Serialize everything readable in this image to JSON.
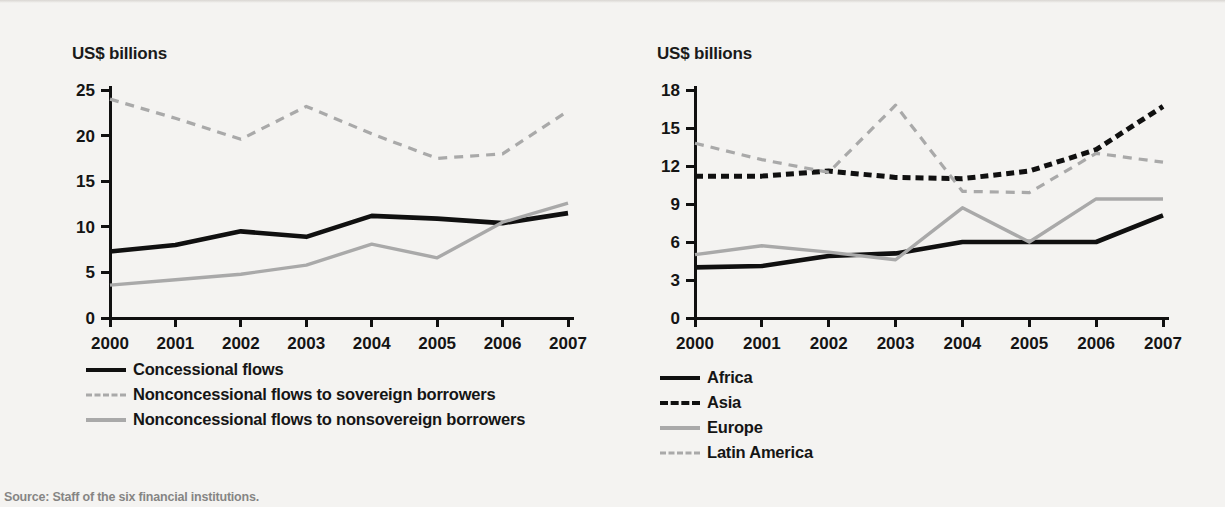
{
  "source_note": "Source: Staff of the six financial institutions.",
  "colors": {
    "black": "#101010",
    "gray": "#a9a9a9",
    "background": "#f4f3f1",
    "text": "#141414"
  },
  "chart_data": [
    {
      "type": "line",
      "panel": "left",
      "title": "US$ billions",
      "xlabel": "",
      "ylabel": "US$ billions",
      "x": [
        "2000",
        "2001",
        "2002",
        "2003",
        "2004",
        "2005",
        "2006",
        "2007"
      ],
      "categories": [
        "2000",
        "2001",
        "2002",
        "2003",
        "2004",
        "2005",
        "2006",
        "2007"
      ],
      "ylim": [
        0,
        25
      ],
      "yticks": [
        0,
        5,
        10,
        15,
        20,
        25
      ],
      "grid": false,
      "legend_position": "below-left",
      "series": [
        {
          "name": "Concessional flows",
          "style": "solid",
          "color": "#101010",
          "values": [
            7.3,
            8.0,
            9.5,
            8.9,
            11.2,
            10.9,
            10.4,
            11.5
          ]
        },
        {
          "name": "Nonconcessional flows to sovereign borrowers",
          "style": "dashed",
          "color": "#a9a9a9",
          "values": [
            24.0,
            21.9,
            19.6,
            23.2,
            20.2,
            17.5,
            18.0,
            22.7
          ]
        },
        {
          "name": "Nonconcessional flows to nonsovereign borrowers",
          "style": "solid",
          "color": "#a9a9a9",
          "values": [
            3.6,
            4.2,
            4.8,
            5.8,
            8.1,
            6.6,
            10.5,
            12.6
          ]
        }
      ],
      "last_point_note": "series 2 ends at 22.7 in 2007"
    },
    {
      "type": "line",
      "panel": "right",
      "title": "US$ billions",
      "xlabel": "",
      "ylabel": "US$ billions",
      "x": [
        "2000",
        "2001",
        "2002",
        "2003",
        "2004",
        "2005",
        "2006",
        "2007"
      ],
      "categories": [
        "2000",
        "2001",
        "2002",
        "2003",
        "2004",
        "2005",
        "2006",
        "2007"
      ],
      "ylim": [
        0,
        18
      ],
      "yticks": [
        0,
        3,
        6,
        9,
        12,
        15,
        18
      ],
      "grid": false,
      "legend_position": "below-center",
      "series": [
        {
          "name": "Africa",
          "style": "solid",
          "color": "#101010",
          "values": [
            4.0,
            4.1,
            4.9,
            5.1,
            6.0,
            6.0,
            6.0,
            8.1
          ]
        },
        {
          "name": "Asia",
          "style": "dashed",
          "color": "#101010",
          "values": [
            11.2,
            11.2,
            11.6,
            11.1,
            11.0,
            11.6,
            13.3,
            16.7
          ]
        },
        {
          "name": "Europe",
          "style": "solid",
          "color": "#a9a9a9",
          "values": [
            5.0,
            5.7,
            5.2,
            4.6,
            8.7,
            6.0,
            9.4,
            9.4
          ]
        },
        {
          "name": "Latin America",
          "style": "dashed",
          "color": "#a9a9a9",
          "values": [
            13.8,
            12.5,
            11.5,
            16.8,
            10.0,
            9.9,
            13.0,
            12.3
          ]
        }
      ]
    }
  ],
  "panels": {
    "left": {
      "axis_title": "US$ billions",
      "yticks": [
        "0",
        "5",
        "10",
        "15",
        "20",
        "25"
      ],
      "xticks": [
        "2000",
        "2001",
        "2002",
        "2003",
        "2004",
        "2005",
        "2006",
        "2007"
      ],
      "legend": [
        {
          "label": "Concessional flows",
          "swatch": "sw-solid-black"
        },
        {
          "label": "Nonconcessional flows to sovereign borrowers",
          "swatch": "sw-dash-gray"
        },
        {
          "label": "Nonconcessional flows to nonsovereign borrowers",
          "swatch": "sw-solid-gray"
        }
      ]
    },
    "right": {
      "axis_title": "US$ billions",
      "yticks": [
        "0",
        "3",
        "6",
        "9",
        "12",
        "15",
        "18"
      ],
      "xticks": [
        "2000",
        "2001",
        "2002",
        "2003",
        "2004",
        "2005",
        "2006",
        "2007"
      ],
      "legend": [
        {
          "label": "Africa",
          "swatch": "sw-solid-black"
        },
        {
          "label": "Asia",
          "swatch": "sw-dash-black"
        },
        {
          "label": "Europe",
          "swatch": "sw-solid-gray"
        },
        {
          "label": "Latin America",
          "swatch": "sw-dash-gray"
        }
      ]
    }
  }
}
